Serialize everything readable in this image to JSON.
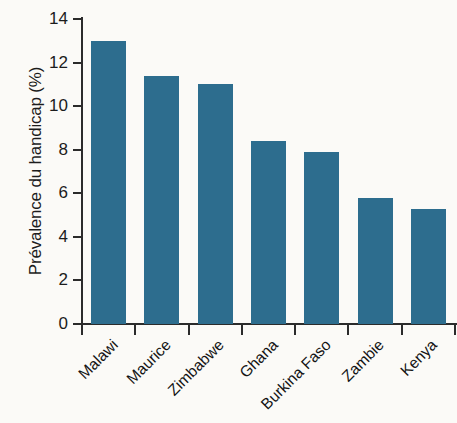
{
  "chart_data": {
    "type": "bar",
    "title": "",
    "subtitle": "",
    "xlabel": "",
    "ylabel": "Prévalence du handicap (%)",
    "categories": [
      "Malawi",
      "Maurice",
      "Zimbabwe",
      "Ghana",
      "Burkina Faso",
      "Zambie",
      "Kenya"
    ],
    "values": [
      13.0,
      11.4,
      11.0,
      8.4,
      7.9,
      5.8,
      5.3
    ],
    "ylim": [
      0,
      14
    ],
    "ytick_labels": [
      "0",
      "2",
      "4",
      "6",
      "8",
      "10",
      "12",
      "14"
    ],
    "ytick_values": [
      0,
      2,
      4,
      6,
      8,
      10,
      12,
      14
    ],
    "grid": false,
    "legend": null,
    "bar_color": "#2d6d8e",
    "axis_color": "#2b2b2b",
    "background_color": "#fbfaf7",
    "xtick_label_rotation": -45
  }
}
